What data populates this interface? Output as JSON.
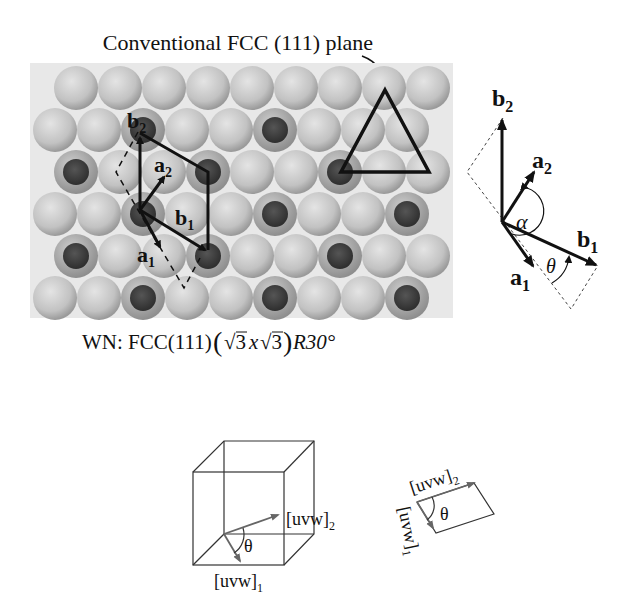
{
  "title": "Conventional FCC (111) plane",
  "caption": {
    "prefix": "WN: FCC(111)",
    "root1": "√3",
    "times": "x",
    "root2": "√3",
    "rotation": "R30°"
  },
  "lattice": {
    "vectors": {
      "a1": "a",
      "a1_sub": "1",
      "a2": "a",
      "a2_sub": "2",
      "b1": "b",
      "b1_sub": "1",
      "b2": "b",
      "b2_sub": "2"
    },
    "colors": {
      "background": "#e8e8e8",
      "sphere_light": "#c4c4c4",
      "sphere_dark": "#3e3e3e",
      "line": "#111111"
    }
  },
  "vector_diagram": {
    "b2": "b",
    "b2_sub": "2",
    "a2": "a",
    "a2_sub": "2",
    "b1": "b",
    "b1_sub": "1",
    "a1": "a",
    "a1_sub": "1",
    "alpha": "α",
    "theta": "θ"
  },
  "cube_diagram": {
    "uvw1": "[uvw]",
    "uvw1_sub": "1",
    "uvw2": "[uvw]",
    "uvw2_sub": "2",
    "theta": "θ"
  },
  "parallelogram_diagram": {
    "uvw1": "[uvw]",
    "uvw1_sub": "1",
    "uvw2": "[uvw]",
    "uvw2_sub": "2",
    "theta": "θ"
  }
}
